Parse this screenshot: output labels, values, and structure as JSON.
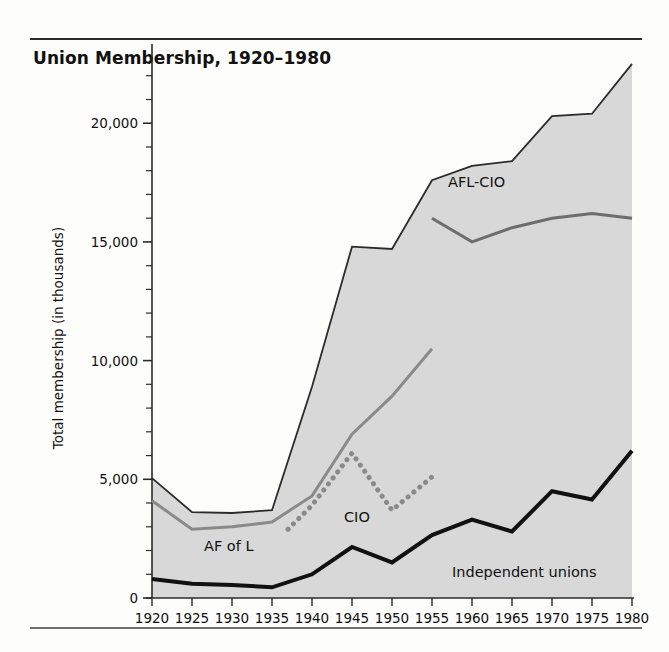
{
  "figure": {
    "title": "Union Membership, 1920–1980"
  },
  "chart_data": {
    "type": "area",
    "title": "Union Membership, 1920–1980",
    "xlabel": "",
    "ylabel": "Total membership  (in thousands)",
    "xlim": [
      1920,
      1980
    ],
    "ylim": [
      0,
      23000
    ],
    "grid": false,
    "legend_position": "inline-annotations",
    "y_major_ticks": [
      0,
      5000,
      10000,
      15000,
      20000
    ],
    "y_major_tick_labels": [
      "0",
      "5,000",
      "10,000",
      "15,000",
      "20,000"
    ],
    "y_minor_tick_interval": 1000,
    "x_ticks": [
      1920,
      1925,
      1930,
      1935,
      1940,
      1945,
      1950,
      1955,
      1960,
      1965,
      1970,
      1975,
      1980
    ],
    "x_tick_labels": [
      "1920",
      "1925",
      "1930",
      "1935",
      "1940",
      "1945",
      "1950",
      "1955",
      "1960",
      "1965",
      "1970",
      "1975",
      "1980"
    ],
    "categories": [
      1920,
      1925,
      1930,
      1935,
      1940,
      1945,
      1950,
      1955,
      1960,
      1965,
      1970,
      1975,
      1980
    ],
    "series": [
      {
        "name": "Total union membership",
        "role": "filled-area-outline",
        "style": "solid",
        "color": "#2b2b2b",
        "fill": "#d8d8d8",
        "x": [
          1920,
          1925,
          1930,
          1935,
          1940,
          1945,
          1950,
          1955,
          1960,
          1965,
          1970,
          1975,
          1980
        ],
        "values": [
          5050,
          3620,
          3580,
          3700,
          8900,
          14800,
          14700,
          17600,
          18200,
          18400,
          20300,
          20400,
          22500
        ]
      },
      {
        "name": "AF of L",
        "role": "line",
        "style": "solid",
        "color": "#8a8a8a",
        "x": [
          1920,
          1925,
          1930,
          1935,
          1940,
          1945,
          1950,
          1955
        ],
        "values": [
          4100,
          2900,
          3000,
          3200,
          4300,
          6900,
          8500,
          10500
        ],
        "label": "AF of L",
        "label_x": 1926.5,
        "label_y": 2000
      },
      {
        "name": "CIO",
        "role": "line",
        "style": "dotted",
        "color": "#8a8a8a",
        "x": [
          1937,
          1940,
          1945,
          1950,
          1955
        ],
        "values": [
          2900,
          3900,
          6100,
          3700,
          5100
        ],
        "label": "CIO",
        "label_x": 1944.0,
        "label_y": 3200
      },
      {
        "name": "AFL-CIO",
        "role": "line",
        "style": "solid",
        "color": "#6d6d6d",
        "x": [
          1955,
          1960,
          1965,
          1970,
          1975,
          1980
        ],
        "values": [
          16000,
          15000,
          15600,
          16000,
          16200,
          16000
        ],
        "label": "AFL-CIO",
        "label_x": 1957.0,
        "label_y": 17300
      },
      {
        "name": "Independent unions",
        "role": "line",
        "style": "solid",
        "color": "#111111",
        "x": [
          1920,
          1925,
          1930,
          1935,
          1940,
          1945,
          1950,
          1955,
          1960,
          1965,
          1970,
          1975,
          1980
        ],
        "values": [
          800,
          600,
          550,
          450,
          1000,
          2150,
          1500,
          2650,
          3300,
          2800,
          4500,
          4150,
          6200
        ],
        "label": "Independent unions",
        "label_x": 1957.5,
        "label_y": 900
      }
    ]
  },
  "annotations": [
    {
      "text": "AFL-CIO"
    },
    {
      "text": "AF of L"
    },
    {
      "text": "CIO"
    },
    {
      "text": "Independent unions"
    }
  ]
}
